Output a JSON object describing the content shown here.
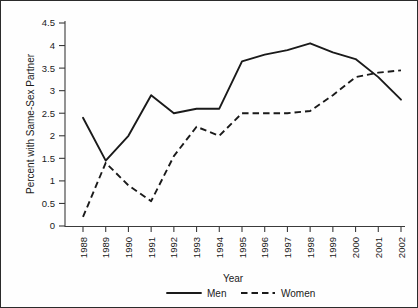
{
  "chart_data": {
    "type": "line",
    "title": "",
    "xlabel": "Year",
    "ylabel": "Percent with Same-Sex Partner",
    "categories": [
      "1988",
      "1989",
      "1990",
      "1991",
      "1992",
      "1993",
      "1994",
      "1995",
      "1996",
      "1997",
      "1998",
      "1999",
      "2000",
      "2001",
      "2002"
    ],
    "x": [
      1988,
      1989,
      1990,
      1991,
      1992,
      1993,
      1994,
      1995,
      1996,
      1997,
      1998,
      1999,
      2000,
      2001,
      2002
    ],
    "xlim": [
      1988,
      2002
    ],
    "ylim": [
      0,
      4.5
    ],
    "yticks": [
      0,
      0.5,
      1,
      1.5,
      2,
      2.5,
      3,
      3.5,
      4,
      4.5
    ],
    "ytick_labels": [
      "0",
      "0.5",
      "1",
      "1.5",
      "2",
      "2.5",
      "3",
      "3.5",
      "4",
      "4.5"
    ],
    "grid": false,
    "legend_position": "bottom",
    "series": [
      {
        "name": "Men",
        "style": "solid",
        "color": "#1a1a1a",
        "values": [
          2.4,
          1.45,
          2.0,
          2.9,
          2.5,
          2.6,
          2.6,
          3.65,
          3.8,
          3.9,
          4.05,
          3.85,
          3.7,
          3.3,
          2.8
        ]
      },
      {
        "name": "Women",
        "style": "dashed",
        "color": "#1a1a1a",
        "values": [
          0.2,
          1.4,
          0.9,
          0.55,
          1.55,
          2.2,
          2.0,
          2.5,
          2.5,
          2.5,
          2.55,
          2.9,
          3.3,
          3.4,
          3.45
        ]
      }
    ]
  },
  "legend": {
    "items": [
      {
        "label": "Men"
      },
      {
        "label": "Women"
      }
    ]
  },
  "axes": {
    "x_title": "Year",
    "y_title": "Percent with Same-Sex Partner"
  }
}
